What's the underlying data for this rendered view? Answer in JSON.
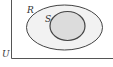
{
  "diagram": {
    "type": "venn",
    "universe": {
      "label": "U"
    },
    "sets": [
      {
        "label": "R",
        "role": "outer",
        "fill": "#f2f2f2"
      },
      {
        "label": "S",
        "role": "inner",
        "fill": "#dcdcdc",
        "subset_of": "R"
      }
    ],
    "colors": {
      "stroke": "#444444",
      "background": "#ffffff"
    }
  }
}
